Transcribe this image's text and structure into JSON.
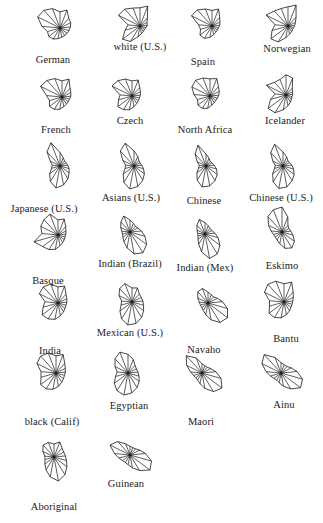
{
  "figure": {
    "type": "star-plot-matrix",
    "background_color": "#ffffff",
    "stroke_color": "#1a1a1a",
    "label_color": "#222222",
    "width": 323,
    "height": 523,
    "columns": 4,
    "rows": 7,
    "spoke_count": 17,
    "radius_scale": 26
  },
  "chart_data": {
    "type": "line",
    "title": "",
    "subtitle": "",
    "xlabel": "",
    "ylabel": "",
    "grid": false,
    "legend": "none",
    "variables": [
      "v1",
      "v2",
      "v3",
      "v4",
      "v5",
      "v6",
      "v7",
      "v8",
      "v9",
      "v10",
      "v11",
      "v12",
      "v13",
      "v14",
      "v15",
      "v16",
      "v17"
    ],
    "value_range": [
      0,
      1
    ],
    "glyphs": [
      {
        "label": "German",
        "cx": 60,
        "cy": 28,
        "lx": 53,
        "ly": 54,
        "values": [
          0.62,
          0.74,
          0.5,
          0.46,
          0.4,
          0.36,
          0.34,
          0.34,
          0.36,
          0.42,
          0.5,
          0.54,
          0.5,
          0.7,
          0.96,
          0.92,
          0.8
        ]
      },
      {
        "label": "white (U.S.)",
        "cx": 140,
        "cy": 26,
        "lx": 140,
        "ly": 41,
        "values": [
          0.7,
          0.82,
          0.42,
          0.3,
          0.28,
          0.24,
          0.22,
          0.24,
          0.3,
          0.42,
          0.7,
          0.84,
          0.6,
          0.46,
          0.92,
          0.88,
          0.74
        ]
      },
      {
        "label": "Spain",
        "cx": 212,
        "cy": 26,
        "lx": 203,
        "ly": 56,
        "values": [
          0.6,
          0.7,
          0.44,
          0.34,
          0.3,
          0.26,
          0.26,
          0.28,
          0.34,
          0.44,
          0.56,
          0.58,
          0.46,
          0.52,
          0.88,
          0.84,
          0.7
        ]
      },
      {
        "label": "Norwegian",
        "cx": 288,
        "cy": 26,
        "lx": 287,
        "ly": 43,
        "values": [
          0.74,
          0.86,
          0.46,
          0.32,
          0.26,
          0.22,
          0.22,
          0.26,
          0.32,
          0.46,
          0.72,
          0.82,
          0.64,
          0.5,
          0.94,
          0.78,
          0.72
        ]
      },
      {
        "label": "French",
        "cx": 62,
        "cy": 97,
        "lx": 56,
        "ly": 124,
        "values": [
          0.62,
          0.74,
          0.46,
          0.38,
          0.34,
          0.3,
          0.3,
          0.32,
          0.38,
          0.48,
          0.56,
          0.6,
          0.5,
          0.6,
          0.92,
          0.86,
          0.76
        ]
      },
      {
        "label": "Czech",
        "cx": 132,
        "cy": 96,
        "lx": 130,
        "ly": 115,
        "values": [
          0.58,
          0.66,
          0.44,
          0.36,
          0.32,
          0.3,
          0.3,
          0.34,
          0.42,
          0.54,
          0.62,
          0.68,
          0.54,
          0.46,
          0.86,
          0.8,
          0.7
        ]
      },
      {
        "label": "North Africa",
        "cx": 210,
        "cy": 96,
        "lx": 205,
        "ly": 124,
        "values": [
          0.66,
          0.72,
          0.48,
          0.4,
          0.34,
          0.3,
          0.28,
          0.3,
          0.36,
          0.48,
          0.56,
          0.58,
          0.5,
          0.62,
          0.78,
          0.82,
          0.74
        ]
      },
      {
        "label": "Icelander",
        "cx": 286,
        "cy": 95,
        "lx": 285,
        "ly": 115,
        "values": [
          0.78,
          0.7,
          0.36,
          0.28,
          0.26,
          0.24,
          0.26,
          0.32,
          0.42,
          0.58,
          0.8,
          0.86,
          0.62,
          0.42,
          0.84,
          0.66,
          0.64
        ]
      },
      {
        "label": "Japanese (U.S.)",
        "cx": 60,
        "cy": 166,
        "lx": 44,
        "ly": 203,
        "values": [
          0.52,
          0.34,
          0.26,
          0.26,
          0.3,
          0.36,
          0.44,
          0.58,
          0.74,
          0.86,
          0.7,
          0.5,
          0.34,
          0.3,
          0.42,
          0.74,
          0.96
        ]
      },
      {
        "label": "Asians (U.S.)",
        "cx": 134,
        "cy": 166,
        "lx": 131,
        "ly": 192,
        "values": [
          0.58,
          0.4,
          0.28,
          0.26,
          0.3,
          0.38,
          0.5,
          0.64,
          0.8,
          0.9,
          0.74,
          0.52,
          0.36,
          0.32,
          0.48,
          0.78,
          0.94
        ]
      },
      {
        "label": "Chinese",
        "cx": 206,
        "cy": 166,
        "lx": 204,
        "ly": 195,
        "values": [
          0.46,
          0.32,
          0.24,
          0.26,
          0.32,
          0.42,
          0.54,
          0.66,
          0.78,
          0.82,
          0.64,
          0.44,
          0.3,
          0.26,
          0.38,
          0.62,
          0.86
        ]
      },
      {
        "label": "Chinese (U.S.)",
        "cx": 283,
        "cy": 166,
        "lx": 281,
        "ly": 192,
        "values": [
          0.54,
          0.38,
          0.28,
          0.28,
          0.34,
          0.42,
          0.54,
          0.66,
          0.82,
          0.88,
          0.72,
          0.5,
          0.34,
          0.3,
          0.44,
          0.7,
          0.9
        ]
      },
      {
        "label": "Basque",
        "cx": 58,
        "cy": 235,
        "lx": 48,
        "ly": 275,
        "values": [
          0.58,
          0.66,
          0.44,
          0.34,
          0.3,
          0.28,
          0.3,
          0.34,
          0.42,
          0.56,
          0.66,
          0.74,
          0.96,
          0.62,
          0.74,
          0.8,
          0.86
        ]
      },
      {
        "label": "Indian (Brazil)",
        "cx": 130,
        "cy": 232,
        "lx": 130,
        "ly": 258,
        "values": [
          0.46,
          0.36,
          0.3,
          0.34,
          0.44,
          0.6,
          0.8,
          0.94,
          0.86,
          0.62,
          0.44,
          0.34,
          0.3,
          0.32,
          0.4,
          0.52,
          0.66
        ]
      },
      {
        "label": "Indian (Mex)",
        "cx": 205,
        "cy": 234,
        "lx": 205,
        "ly": 262,
        "values": [
          0.44,
          0.34,
          0.28,
          0.3,
          0.38,
          0.52,
          0.72,
          0.9,
          0.96,
          0.7,
          0.46,
          0.34,
          0.28,
          0.28,
          0.34,
          0.46,
          0.6
        ]
      },
      {
        "label": "Eskimo",
        "cx": 282,
        "cy": 232,
        "lx": 282,
        "ly": 260,
        "values": [
          0.96,
          0.62,
          0.34,
          0.3,
          0.34,
          0.44,
          0.6,
          0.72,
          0.64,
          0.46,
          0.36,
          0.32,
          0.34,
          0.42,
          0.58,
          0.8,
          0.92
        ]
      },
      {
        "label": "India",
        "cx": 58,
        "cy": 303,
        "lx": 50,
        "ly": 345,
        "values": [
          0.62,
          0.7,
          0.46,
          0.38,
          0.34,
          0.32,
          0.34,
          0.4,
          0.5,
          0.64,
          0.72,
          0.76,
          0.6,
          0.5,
          0.8,
          0.84,
          0.78
        ]
      },
      {
        "label": "Mexican (U.S.)",
        "cx": 132,
        "cy": 302,
        "lx": 130,
        "ly": 327,
        "values": [
          0.54,
          0.58,
          0.42,
          0.4,
          0.42,
          0.46,
          0.56,
          0.7,
          0.84,
          0.9,
          0.76,
          0.58,
          0.44,
          0.4,
          0.56,
          0.7,
          0.76
        ]
      },
      {
        "label": "Navaho",
        "cx": 208,
        "cy": 303,
        "lx": 204,
        "ly": 344,
        "values": [
          0.42,
          0.34,
          0.32,
          0.4,
          0.56,
          0.78,
          0.94,
          0.88,
          0.66,
          0.46,
          0.34,
          0.3,
          0.3,
          0.34,
          0.44,
          0.58,
          0.6
        ]
      },
      {
        "label": "Bantu",
        "cx": 284,
        "cy": 302,
        "lx": 286,
        "ly": 333,
        "values": [
          0.7,
          0.82,
          0.52,
          0.4,
          0.34,
          0.32,
          0.34,
          0.4,
          0.5,
          0.62,
          0.7,
          0.72,
          0.58,
          0.56,
          0.84,
          0.92,
          0.86
        ]
      },
      {
        "label": "black (Calif)",
        "cx": 56,
        "cy": 373,
        "lx": 52,
        "ly": 416,
        "values": [
          0.66,
          0.76,
          0.5,
          0.4,
          0.36,
          0.34,
          0.36,
          0.42,
          0.52,
          0.64,
          0.72,
          0.74,
          0.6,
          0.58,
          0.82,
          0.88,
          0.82
        ]
      },
      {
        "label": "Egyptian",
        "cx": 128,
        "cy": 373,
        "lx": 129,
        "ly": 400,
        "values": [
          0.72,
          0.56,
          0.4,
          0.36,
          0.38,
          0.44,
          0.54,
          0.66,
          0.78,
          0.86,
          0.8,
          0.66,
          0.5,
          0.42,
          0.56,
          0.74,
          0.86
        ]
      },
      {
        "label": "Maori",
        "cx": 202,
        "cy": 373,
        "lx": 201,
        "ly": 416,
        "values": [
          0.36,
          0.3,
          0.3,
          0.38,
          0.54,
          0.76,
          0.96,
          0.84,
          0.6,
          0.42,
          0.32,
          0.3,
          0.34,
          0.44,
          0.66,
          0.9,
          0.62
        ]
      },
      {
        "label": "Ainu",
        "cx": 281,
        "cy": 373,
        "lx": 284,
        "ly": 399,
        "values": [
          0.4,
          0.34,
          0.34,
          0.44,
          0.62,
          0.86,
          0.94,
          0.72,
          0.52,
          0.38,
          0.32,
          0.34,
          0.42,
          0.58,
          0.82,
          0.96,
          0.64
        ]
      },
      {
        "label": "Aboriginal",
        "cx": 54,
        "cy": 457,
        "lx": 54,
        "ly": 501,
        "values": [
          0.5,
          0.62,
          0.46,
          0.42,
          0.44,
          0.5,
          0.62,
          0.8,
          0.94,
          0.78,
          0.58,
          0.44,
          0.36,
          0.36,
          0.48,
          0.62,
          0.6
        ]
      },
      {
        "label": "Guinean",
        "cx": 130,
        "cy": 455,
        "lx": 126,
        "ly": 478,
        "values": [
          0.34,
          0.3,
          0.32,
          0.42,
          0.6,
          0.86,
          0.96,
          0.7,
          0.5,
          0.38,
          0.34,
          0.36,
          0.44,
          0.6,
          0.86,
          0.7,
          0.46
        ]
      }
    ]
  }
}
